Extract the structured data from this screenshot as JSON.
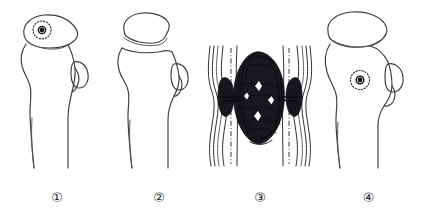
{
  "figure": {
    "background_color": "#ffffff",
    "ink_color": "#3b3b44",
    "mass_color": "#121217",
    "panel_count": 4
  },
  "panels": [
    {
      "id": "panel-1",
      "caption": "①",
      "name": "proximal-femur-stage-1",
      "description": "Proximal femur outline with rounded head, dotted circular lesion and dark focal core in the femoral head, greater trochanter ellipse on lateral side, open-ended diaphyseal shaft lines.",
      "lesion": {
        "present": true,
        "location": "femoral-head",
        "style": "dotted-ring-with-dark-core"
      },
      "head_shape": "rounded-preserved",
      "trochanter_ellipse": true
    },
    {
      "id": "panel-2",
      "caption": "②",
      "name": "proximal-femur-stage-2",
      "description": "Proximal femur with flattened, collapsed and separated femoral head fragment resting above the neck, no visible lesion marking, greater trochanter ellipse, open-ended shaft lines.",
      "lesion": {
        "present": false,
        "location": "",
        "style": ""
      },
      "head_shape": "flattened-collapsed-separated",
      "trochanter_ellipse": true
    },
    {
      "id": "panel-3",
      "caption": "③",
      "name": "diaphyseal-dense-lesion",
      "description": "Longitudinal bone segment shown as paired wavy cortical lines on each side with dash-dot medullary axis lines; a large dense scribbled fusiform mass occupies the medullary cavity with smaller dark lobes abutting each cortex and transverse spicule spikes.",
      "lesion": {
        "present": true,
        "location": "medullary-cavity",
        "style": "dense-scribbled-fusiform-mass"
      },
      "cortical_lines_per_side": 4,
      "axis_lines": 2
    },
    {
      "id": "panel-4",
      "caption": "④",
      "name": "proximal-femur-stage-4",
      "description": "Proximal femur with a large rounded, slightly mushroomed femoral head, dotted circular lesion with dark core located in the femoral neck region, greater trochanter ellipse, open-ended shaft lines.",
      "lesion": {
        "present": true,
        "location": "femoral-neck",
        "style": "dotted-ring-with-dark-core"
      },
      "head_shape": "enlarged-rounded",
      "trochanter_ellipse": true
    }
  ]
}
